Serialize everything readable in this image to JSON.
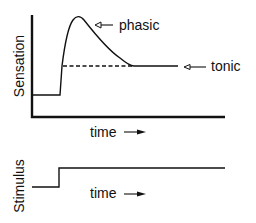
{
  "diagram": {
    "upper_panel": {
      "y_axis_label": "Sensation",
      "x_axis_label": "time",
      "x_axis_arrow": "→",
      "annotations": {
        "phasic": "phasic",
        "tonic": "tonic"
      },
      "curve": {
        "baseline_level": "low",
        "onset": "step rise",
        "peak": "phasic overshoot",
        "steady_state": "tonic plateau (dashed reference line)"
      }
    },
    "lower_panel": {
      "y_axis_label": "Stimulus",
      "x_axis_label": "time",
      "x_axis_arrow": "→",
      "trace": "step function: low then sustained high"
    },
    "colors": {
      "ink": "#111111",
      "background": "#ffffff"
    }
  }
}
